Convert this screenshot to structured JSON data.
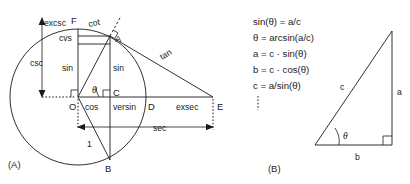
{
  "figure": {
    "panel_a": {
      "label": "(A)",
      "points": {
        "F": "F",
        "A": "A",
        "O": "O",
        "B": "B",
        "C": "C",
        "D": "D",
        "E": "E"
      },
      "segment_labels": {
        "excsc": "excsc",
        "cot": "cot",
        "cvs": "cvs",
        "csc": "csc",
        "sin_left": "sin",
        "sin_right": "sin",
        "tan": "tan",
        "theta": "θ",
        "cos": "cos",
        "versin": "versin",
        "exsec": "exsec",
        "sec": "sec",
        "radius": "1"
      }
    },
    "panel_b": {
      "label": "(B)",
      "equations": [
        "sin(θ) = a/c",
        "θ = arcsin(a/c)",
        "a = c · sin(θ)",
        "b = c · cos(θ)",
        "c = a/sin(θ)"
      ],
      "triangle_labels": {
        "hypotenuse": "c",
        "opposite": "a",
        "adjacent": "b",
        "angle": "θ"
      }
    }
  },
  "colors": {
    "ink": "#1a1a1a",
    "background": "#ffffff"
  }
}
